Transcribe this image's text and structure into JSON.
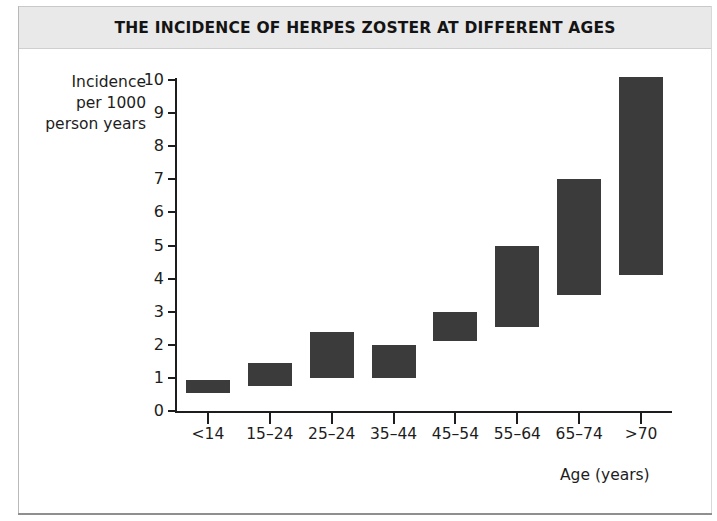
{
  "figure": {
    "title": "THE INCIDENCE OF HERPES ZOSTER AT DIFFERENT AGES",
    "x_axis_title": "Age (years)",
    "y_axis_title_line1": "Incidence",
    "y_axis_title_line2": "per 1000",
    "y_axis_title_line3": "person years",
    "colors": {
      "bar": "#3b3b3b",
      "axis": "#1d1d1d",
      "title_band": "#e9e9e9",
      "background": "#ffffff",
      "frame": "#b9b9b9"
    }
  },
  "chart_data": {
    "type": "bar",
    "title": "THE INCIDENCE OF HERPES ZOSTER AT DIFFERENT AGES",
    "xlabel": "Age (years)",
    "ylabel": "Incidence per 1000 person years",
    "ylim": [
      0,
      10
    ],
    "yticks": [
      0,
      1,
      2,
      3,
      4,
      5,
      6,
      7,
      8,
      9,
      10
    ],
    "ytick_labels": [
      "0",
      "1",
      "2",
      "3",
      "4",
      "5",
      "6",
      "7",
      "8",
      "9",
      "10"
    ],
    "grid": false,
    "legend": "none",
    "bar_style": "floating range bars (low to high)",
    "categories": [
      "<14",
      "15–24",
      "25–24",
      "35–44",
      "45–54",
      "55–64",
      "65–74",
      ">70"
    ],
    "series": [
      {
        "name": "Incidence range per 1000 person years",
        "low": [
          0.55,
          0.75,
          1.0,
          1.0,
          2.1,
          2.55,
          3.5,
          4.1
        ],
        "high": [
          0.95,
          1.45,
          2.4,
          2.0,
          3.0,
          5.0,
          7.0,
          10.1
        ]
      }
    ],
    "bars": [
      {
        "category": "<14",
        "low": 0.55,
        "high": 0.95
      },
      {
        "category": "15–24",
        "low": 0.75,
        "high": 1.45
      },
      {
        "category": "25–24",
        "low": 1.0,
        "high": 2.4
      },
      {
        "category": "35–44",
        "low": 1.0,
        "high": 2.0
      },
      {
        "category": "45–54",
        "low": 2.1,
        "high": 3.0
      },
      {
        "category": "55–64",
        "low": 2.55,
        "high": 5.0
      },
      {
        "category": "65–74",
        "low": 3.5,
        "high": 7.0
      },
      {
        "category": ">70",
        "low": 4.1,
        "high": 10.1
      }
    ]
  }
}
